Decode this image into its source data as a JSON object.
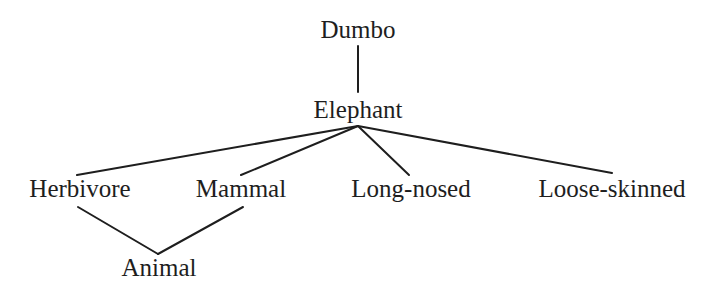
{
  "diagram": {
    "type": "concept-hierarchy",
    "nodes": [
      {
        "id": "dumbo",
        "label": "Dumbo"
      },
      {
        "id": "elephant",
        "label": "Elephant"
      },
      {
        "id": "herbivore",
        "label": "Herbivore"
      },
      {
        "id": "mammal",
        "label": "Mammal"
      },
      {
        "id": "long_nosed",
        "label": "Long-nosed"
      },
      {
        "id": "loose_skinned",
        "label": "Loose-skinned"
      },
      {
        "id": "animal",
        "label": "Animal"
      }
    ],
    "edges": [
      {
        "from": "dumbo",
        "to": "elephant"
      },
      {
        "from": "elephant",
        "to": "herbivore"
      },
      {
        "from": "elephant",
        "to": "mammal"
      },
      {
        "from": "elephant",
        "to": "long_nosed"
      },
      {
        "from": "elephant",
        "to": "loose_skinned"
      },
      {
        "from": "herbivore",
        "to": "animal"
      },
      {
        "from": "mammal",
        "to": "animal"
      }
    ]
  }
}
